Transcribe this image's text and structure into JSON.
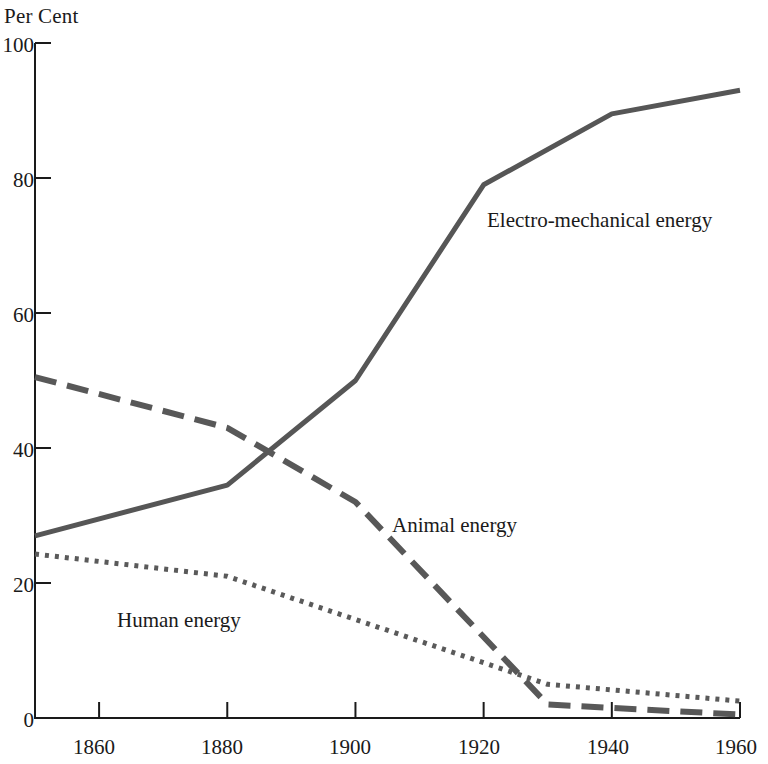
{
  "chart_data": {
    "type": "line",
    "title": "",
    "ylabel": "Per Cent",
    "xlabel": "",
    "xlim": [
      1850,
      1960
    ],
    "ylim": [
      0,
      100
    ],
    "grid": false,
    "legend_position": "inline-annotations",
    "ytick_labels": [
      "100",
      "80",
      "60",
      "40",
      "20",
      "0"
    ],
    "yticks": [
      100,
      80,
      60,
      40,
      20,
      0
    ],
    "xtick_labels": [
      "1860",
      "1880",
      "1900",
      "1920",
      "1940",
      "1960"
    ],
    "xticks": [
      1860,
      1880,
      1900,
      1920,
      1940,
      1960
    ],
    "series": [
      {
        "name": "Electro-mechanical energy",
        "style": "solid",
        "color": "#565656",
        "x": [
          1850,
          1880,
          1900,
          1920,
          1940,
          1960
        ],
        "values": [
          27,
          34.5,
          50,
          79,
          89.5,
          93
        ]
      },
      {
        "name": "Animal energy",
        "style": "dashed",
        "color": "#585858",
        "x": [
          1850,
          1880,
          1900,
          1930,
          1960
        ],
        "values": [
          50.5,
          43,
          32,
          2,
          0.5
        ]
      },
      {
        "name": "Human energy",
        "style": "dotted",
        "color": "#5a5a5a",
        "x": [
          1850,
          1880,
          1930,
          1960
        ],
        "values": [
          24.3,
          21,
          5,
          2.5
        ]
      }
    ],
    "annotations": [
      {
        "text": "Electro-mechanical energy",
        "x": 1920,
        "y": 76
      },
      {
        "text": "Animal energy",
        "x": 1903,
        "y": 30
      },
      {
        "text": "Human energy",
        "x": 1862,
        "y": 14
      }
    ]
  },
  "colors": {
    "axis": "#1a1a1a",
    "series_gray": "#565656",
    "background": "#ffffff"
  }
}
